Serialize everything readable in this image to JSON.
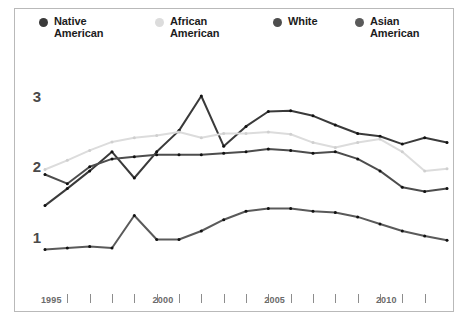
{
  "chart_data": {
    "type": "line",
    "title": "",
    "subtitle": "",
    "xlabel": "",
    "ylabel": "",
    "grid": false,
    "legend_position": "top",
    "xlim": [
      1994,
      2012
    ],
    "ylim": [
      0.45,
      3.25
    ],
    "y_ticks": [
      1,
      2,
      3
    ],
    "y_tick_labels": [
      "1",
      "2",
      "3"
    ],
    "x_ticks": [
      1995,
      1996,
      1997,
      1998,
      1999,
      2000,
      2001,
      2002,
      2003,
      2004,
      2005,
      2006,
      2007,
      2008,
      2009,
      2010,
      2011
    ],
    "x_tick_labels": [
      "1995",
      "",
      "",
      "",
      "",
      "2000",
      "",
      "",
      "",
      "",
      "2005",
      "",
      "",
      "",
      "",
      "2010",
      ""
    ],
    "x": [
      1994,
      1995,
      1996,
      1997,
      1998,
      1999,
      2000,
      2001,
      2002,
      2003,
      2004,
      2005,
      2006,
      2007,
      2008,
      2009,
      2010,
      2011,
      2012
    ],
    "series": [
      {
        "name": "Native American",
        "color": "#3a3a3a",
        "values": [
          1.46,
          1.7,
          1.95,
          2.22,
          1.85,
          2.22,
          2.52,
          3.01,
          2.3,
          2.58,
          2.79,
          2.8,
          2.73,
          2.6,
          2.48,
          2.44,
          2.33,
          2.42,
          2.35
        ]
      },
      {
        "name": "African American",
        "color": "#dcdcdc",
        "values": [
          1.97,
          2.1,
          2.24,
          2.36,
          2.42,
          2.45,
          2.5,
          2.42,
          2.48,
          2.48,
          2.5,
          2.47,
          2.35,
          2.28,
          2.35,
          2.4,
          2.22,
          1.95,
          1.98
        ]
      },
      {
        "name": "White",
        "color": "#4d4d4d",
        "values": [
          1.9,
          1.77,
          2.01,
          2.12,
          2.15,
          2.18,
          2.18,
          2.18,
          2.2,
          2.22,
          2.26,
          2.24,
          2.2,
          2.22,
          2.12,
          1.95,
          1.72,
          1.66,
          1.7
        ]
      },
      {
        "name": "Asian American",
        "color": "#5a5a5a",
        "values": [
          0.84,
          0.86,
          0.88,
          0.86,
          1.32,
          0.98,
          0.98,
          1.1,
          1.26,
          1.38,
          1.42,
          1.42,
          1.38,
          1.36,
          1.3,
          1.2,
          1.1,
          1.03,
          0.97
        ]
      }
    ]
  },
  "legend": {
    "items": [
      {
        "label": "Native\nAmerican",
        "dot": "legend-dot-native-american"
      },
      {
        "label": "African\nAmerican",
        "dot": "legend-dot-african-american"
      },
      {
        "label": "White",
        "dot": "legend-dot-white"
      },
      {
        "label": "Asian\nAmerican",
        "dot": "legend-dot-asian-american"
      }
    ]
  }
}
